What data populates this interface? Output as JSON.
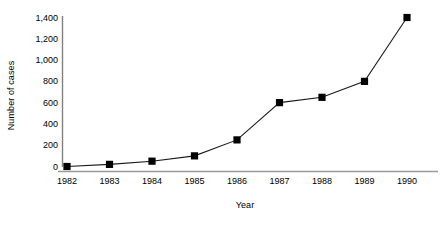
{
  "chart_data": {
    "type": "line",
    "title": "",
    "xlabel": "Year",
    "ylabel": "Number of cases",
    "categories": [
      "1982",
      "1983",
      "1984",
      "1985",
      "1986",
      "1987",
      "1988",
      "1989",
      "1990"
    ],
    "values": [
      0,
      20,
      50,
      100,
      250,
      600,
      650,
      800,
      1400
    ],
    "series": [
      {
        "name": "Number of cases",
        "values": [
          0,
          20,
          50,
          100,
          250,
          600,
          650,
          800,
          1400
        ]
      }
    ],
    "ylim": [
      0,
      1400
    ],
    "yticks": [
      0,
      200,
      400,
      600,
      800,
      1000,
      1200,
      1400
    ],
    "ytick_labels": [
      "0",
      "200",
      "400",
      "600",
      "800",
      "1,000",
      "1,200",
      "1,400"
    ],
    "grid": false,
    "legend": "none",
    "marker": "square",
    "marker_color": "#000000",
    "line_color": "#000000",
    "axis_color": "#808080",
    "background": "#ffffff"
  }
}
